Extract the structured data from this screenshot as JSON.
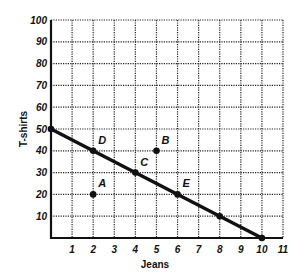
{
  "chart_data": {
    "type": "line",
    "title": "",
    "xlabel": "Jeans",
    "ylabel": "T-shirts",
    "xlim": [
      0,
      11
    ],
    "ylim": [
      0,
      100
    ],
    "x_ticks": [
      1,
      2,
      3,
      4,
      5,
      6,
      7,
      8,
      9,
      10,
      11
    ],
    "y_ticks": [
      10,
      20,
      30,
      40,
      50,
      60,
      70,
      80,
      90,
      100
    ],
    "grid": true,
    "grid_style": "dotted",
    "legend": null,
    "series": [
      {
        "name": "Production possibilities frontier",
        "x": [
          0,
          10
        ],
        "y": [
          50,
          0
        ]
      }
    ],
    "points": [
      {
        "label": "D",
        "x": 2,
        "y": 40,
        "on_line": true
      },
      {
        "label": "C",
        "x": 4,
        "y": 30,
        "on_line": true
      },
      {
        "label": "E",
        "x": 6,
        "y": 20,
        "on_line": true
      },
      {
        "label": "",
        "x": 8,
        "y": 10,
        "on_line": true
      },
      {
        "label": "",
        "x": 10,
        "y": 0,
        "on_line": true
      },
      {
        "label": "",
        "x": 0,
        "y": 50,
        "on_line": true
      },
      {
        "label": "A",
        "x": 2,
        "y": 20,
        "on_line": false
      },
      {
        "label": "B",
        "x": 5,
        "y": 40,
        "on_line": false
      }
    ],
    "colors": {
      "line": "#111111",
      "grid": "#222222",
      "background": "#ffffff"
    }
  }
}
